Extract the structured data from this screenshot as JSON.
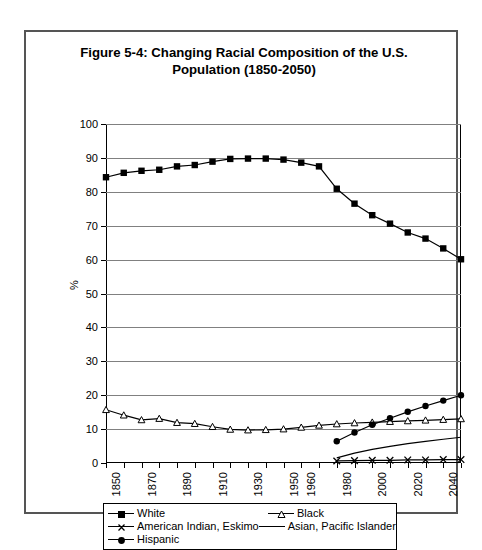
{
  "figure": {
    "title_line1": "Figure 5-4: Changing Racial Composition of the U.S.",
    "title_line2": "Population (1850-2050)"
  },
  "axes": {
    "ylabel": "%",
    "ytick_labels": [
      "100",
      "90",
      "80",
      "70",
      "60",
      "50",
      "40",
      "30",
      "20",
      "10",
      "0"
    ],
    "xtick_labels": [
      "1850",
      "1870",
      "1890",
      "1910",
      "1930",
      "1950",
      "1960",
      "1980",
      "2000",
      "2020",
      "2040"
    ]
  },
  "legend": {
    "items": [
      {
        "label": "White",
        "marker": "filled-square"
      },
      {
        "label": "Black",
        "marker": "open-triangle"
      },
      {
        "label": "American Indian, Eskimo",
        "marker": "cross-x"
      },
      {
        "label": "Asian, Pacific Islander",
        "marker": "plain-line"
      },
      {
        "label": "Hispanic",
        "marker": "filled-circle"
      }
    ]
  },
  "colors": {
    "line": "#000000",
    "grid": "#808080",
    "border": "#555555",
    "background": "#ffffff"
  },
  "chart_data": {
    "type": "line",
    "title": "Figure 5-4: Changing Racial Composition of the U.S. Population (1850-2050)",
    "xlabel": "",
    "ylabel": "%",
    "xlim": [
      1850,
      2050
    ],
    "ylim": [
      0,
      100
    ],
    "grid": true,
    "legend_position": "bottom",
    "x": [
      1850,
      1860,
      1870,
      1880,
      1890,
      1900,
      1910,
      1920,
      1930,
      1940,
      1950,
      1960,
      1970,
      1980,
      1990,
      2000,
      2010,
      2020,
      2030,
      2040,
      2050
    ],
    "series": [
      {
        "name": "White",
        "marker": "filled-square",
        "x": [
          1850,
          1860,
          1870,
          1880,
          1890,
          1900,
          1910,
          1920,
          1930,
          1940,
          1950,
          1960,
          1970,
          1980,
          1990,
          2000,
          2010,
          2020,
          2030,
          2040,
          2050
        ],
        "values": [
          84.3,
          85.6,
          86.2,
          86.5,
          87.5,
          87.9,
          88.9,
          89.7,
          89.8,
          89.8,
          89.5,
          88.6,
          87.5,
          80.9,
          76.5,
          73.1,
          70.6,
          68.0,
          66.2,
          63.3,
          60.1
        ]
      },
      {
        "name": "Black",
        "marker": "open-triangle",
        "x": [
          1850,
          1860,
          1870,
          1880,
          1890,
          1900,
          1910,
          1920,
          1930,
          1940,
          1950,
          1960,
          1970,
          1980,
          1990,
          2000,
          2010,
          2020,
          2030,
          2040,
          2050
        ],
        "values": [
          15.7,
          14.1,
          12.7,
          13.1,
          11.9,
          11.6,
          10.7,
          9.9,
          9.7,
          9.8,
          10.0,
          10.5,
          11.1,
          11.5,
          11.8,
          12.0,
          12.2,
          12.4,
          12.6,
          12.8,
          13.0
        ]
      },
      {
        "name": "American Indian, Eskimo",
        "marker": "cross-x",
        "x": [
          1980,
          1990,
          2000,
          2010,
          2020,
          2030,
          2040,
          2050
        ],
        "values": [
          0.6,
          0.7,
          0.8,
          0.8,
          0.9,
          0.9,
          1.0,
          1.0
        ]
      },
      {
        "name": "Asian, Pacific Islander",
        "marker": "plain-line",
        "x": [
          1980,
          1990,
          2000,
          2010,
          2020,
          2030,
          2040,
          2050
        ],
        "values": [
          1.5,
          2.9,
          4.0,
          4.9,
          5.7,
          6.4,
          7.0,
          7.6
        ]
      },
      {
        "name": "Hispanic",
        "marker": "filled-circle",
        "x": [
          1980,
          1990,
          2000,
          2010,
          2020,
          2030,
          2040,
          2050
        ],
        "values": [
          6.4,
          9.0,
          11.3,
          13.2,
          15.1,
          16.8,
          18.4,
          20.0
        ]
      }
    ]
  }
}
